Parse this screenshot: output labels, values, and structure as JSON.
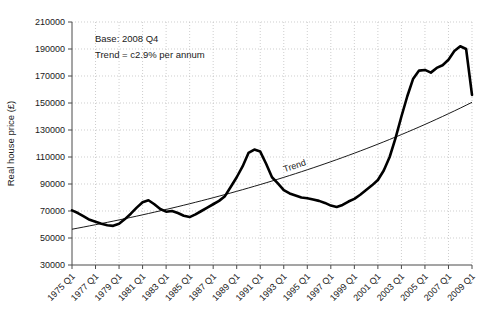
{
  "chart_data": {
    "type": "line",
    "title": "",
    "xlabel": "",
    "ylabel": "Real house price (£)",
    "ylim": [
      30000,
      210000
    ],
    "ytick_values": [
      30000,
      50000,
      70000,
      90000,
      110000,
      130000,
      150000,
      170000,
      190000,
      210000
    ],
    "ytick_labels": [
      "30000",
      "50000",
      "70000",
      "90000",
      "110000",
      "130000",
      "150000",
      "170000",
      "190000",
      "210000"
    ],
    "xlim": [
      "1975 Q1",
      "2009 Q1"
    ],
    "xtick_labels": [
      "1975 Q1",
      "1977 Q1",
      "1979 Q1",
      "1981 Q1",
      "1983 Q1",
      "1985 Q1",
      "1987 Q1",
      "1989 Q1",
      "1991 Q1",
      "1993 Q1",
      "1995 Q1",
      "1997 Q1",
      "1999 Q1",
      "2001 Q1",
      "2003 Q1",
      "2005 Q1",
      "2007 Q1",
      "2009 Q1"
    ],
    "grid": true,
    "legend": "none",
    "annotations": [
      {
        "name": "base-note",
        "text": "Base: 2008 Q4"
      },
      {
        "name": "trend-note",
        "text": "Trend = c2.9% per annum"
      },
      {
        "name": "trend-line-label",
        "text": "Trend"
      }
    ],
    "series": [
      {
        "name": "Real house price",
        "color": "#000000",
        "x": [
          "1975 Q1",
          "1975 Q3",
          "1976 Q1",
          "1976 Q3",
          "1977 Q1",
          "1977 Q3",
          "1978 Q1",
          "1978 Q3",
          "1979 Q1",
          "1979 Q3",
          "1980 Q1",
          "1980 Q3",
          "1981 Q1",
          "1981 Q3",
          "1982 Q1",
          "1982 Q3",
          "1983 Q1",
          "1983 Q3",
          "1984 Q1",
          "1984 Q3",
          "1985 Q1",
          "1985 Q3",
          "1986 Q1",
          "1986 Q3",
          "1987 Q1",
          "1987 Q3",
          "1988 Q1",
          "1988 Q3",
          "1989 Q1",
          "1989 Q3",
          "1990 Q1",
          "1990 Q3",
          "1991 Q1",
          "1991 Q3",
          "1992 Q1",
          "1992 Q3",
          "1993 Q1",
          "1993 Q3",
          "1994 Q1",
          "1994 Q3",
          "1995 Q1",
          "1995 Q3",
          "1996 Q1",
          "1996 Q3",
          "1997 Q1",
          "1997 Q3",
          "1998 Q1",
          "1998 Q3",
          "1999 Q1",
          "1999 Q3",
          "2000 Q1",
          "2000 Q3",
          "2001 Q1",
          "2001 Q3",
          "2002 Q1",
          "2002 Q3",
          "2003 Q1",
          "2003 Q3",
          "2004 Q1",
          "2004 Q3",
          "2005 Q1",
          "2005 Q3",
          "2006 Q1",
          "2006 Q3",
          "2007 Q1",
          "2007 Q3",
          "2008 Q1",
          "2008 Q3",
          "2009 Q1"
        ],
        "values": [
          70500,
          68500,
          66000,
          63500,
          62000,
          60500,
          59500,
          59000,
          60500,
          64000,
          68000,
          72500,
          76500,
          78000,
          75000,
          71500,
          69500,
          70000,
          68500,
          66500,
          65500,
          67500,
          70000,
          72500,
          75000,
          77500,
          81000,
          88000,
          95000,
          103000,
          113000,
          115500,
          114000,
          105000,
          95000,
          90500,
          85500,
          83000,
          81500,
          80000,
          79500,
          78500,
          77500,
          76000,
          74000,
          73000,
          74500,
          77000,
          79000,
          82000,
          85500,
          89000,
          93000,
          100000,
          110000,
          124000,
          140000,
          155000,
          168000,
          174000,
          174500,
          172500,
          176000,
          178000,
          182000,
          188500,
          192000,
          190000,
          156000
        ]
      },
      {
        "name": "Trend",
        "color": "#000000",
        "x": [
          "1975 Q1",
          "2009 Q1"
        ],
        "values": [
          56500,
          150500
        ],
        "note": "exponential trend, c2.9% per annum, base 2008 Q4"
      }
    ]
  }
}
